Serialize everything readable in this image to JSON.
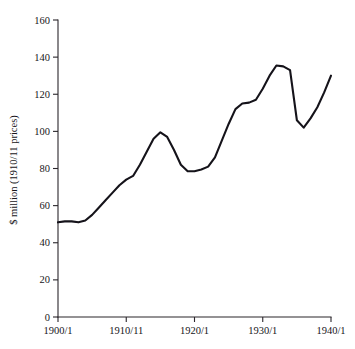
{
  "chart_data": {
    "type": "line",
    "title": "",
    "subtitle": "",
    "xlabel": "",
    "ylabel": "$ million (1910/11 prices)",
    "xlim": [
      1900,
      1940
    ],
    "ylim": [
      0,
      160
    ],
    "grid": false,
    "legend": "none",
    "x_tick_labels": [
      "1900/1",
      "1910/11",
      "1920/1",
      "1930/1",
      "1940/1"
    ],
    "x_tick_values": [
      1900,
      1910,
      1920,
      1930,
      1940
    ],
    "y_tick_labels": [
      "0",
      "20",
      "40",
      "60",
      "80",
      "100",
      "120",
      "140",
      "160"
    ],
    "y_tick_values": [
      0,
      20,
      40,
      60,
      80,
      100,
      120,
      140,
      160
    ],
    "series": [
      {
        "name": "Real value",
        "color": "#15131a",
        "x": [
          1900,
          1901,
          1902,
          1903,
          1904,
          1905,
          1906,
          1907,
          1908,
          1909,
          1910,
          1911,
          1912,
          1913,
          1914,
          1915,
          1916,
          1917,
          1918,
          1919,
          1920,
          1921,
          1922,
          1923,
          1924,
          1925,
          1926,
          1927,
          1928,
          1929,
          1930,
          1931,
          1932,
          1933,
          1934,
          1935,
          1936,
          1937,
          1938
        ],
        "y": [
          51,
          51.5,
          51.5,
          51,
          52,
          55,
          59,
          63,
          67,
          71,
          74,
          76,
          82,
          89,
          96,
          99.5,
          97,
          90,
          82,
          78.5,
          78.5,
          79.5,
          81,
          86,
          95,
          104,
          112,
          115,
          115.5,
          117,
          123,
          130,
          135.5,
          135,
          133,
          106,
          102,
          107,
          113
        ]
      }
    ],
    "series_extension": {
      "note": "continuation of the single series after 1938",
      "x": [
        1938,
        1939,
        1940
      ],
      "y": [
        113,
        121,
        130
      ]
    }
  },
  "axis": {
    "y_title": "$ million (1910/11 prices)"
  }
}
